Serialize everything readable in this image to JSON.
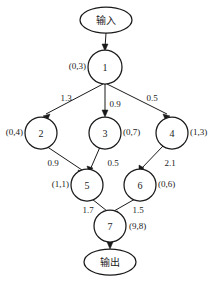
{
  "diagram": {
    "type": "directed-graph",
    "title": "",
    "terminals": [
      {
        "id": "input",
        "label": "输入",
        "cx": 106,
        "cy": 20,
        "rx": 26,
        "ry": 13
      },
      {
        "id": "output",
        "label": "输出",
        "cx": 110,
        "cy": 262,
        "rx": 26,
        "ry": 13
      }
    ],
    "nodes": [
      {
        "id": "1",
        "label": "1",
        "annotation": "(0,3)",
        "annotation_side": "left",
        "cx": 105,
        "cy": 67,
        "r": 17
      },
      {
        "id": "2",
        "label": "2",
        "annotation": "(0,4)",
        "annotation_side": "left",
        "cx": 41,
        "cy": 133,
        "r": 16
      },
      {
        "id": "3",
        "label": "3",
        "annotation": "(0,7)",
        "annotation_side": "right",
        "cx": 105,
        "cy": 133,
        "r": 16
      },
      {
        "id": "4",
        "label": "4",
        "annotation": "(1,3)",
        "annotation_side": "right",
        "cx": 172,
        "cy": 133,
        "r": 16
      },
      {
        "id": "5",
        "label": "5",
        "annotation": "(1,1)",
        "annotation_side": "left",
        "cx": 87,
        "cy": 185,
        "r": 16
      },
      {
        "id": "6",
        "label": "6",
        "annotation": "(0,6)",
        "annotation_side": "right",
        "cx": 140,
        "cy": 185,
        "r": 16
      },
      {
        "id": "7",
        "label": "7",
        "annotation": "(9,8)",
        "annotation_side": "right",
        "cx": 110,
        "cy": 226,
        "r": 16
      }
    ],
    "edges": [
      {
        "from": "input",
        "to": "1",
        "label": "",
        "label_x": 0,
        "label_y": 0
      },
      {
        "from": "1",
        "to": "2",
        "label": "1.3",
        "label_x": 66,
        "label_y": 98
      },
      {
        "from": "1",
        "to": "3",
        "label": "0.9",
        "label_x": 115,
        "label_y": 104
      },
      {
        "from": "1",
        "to": "4",
        "label": "0.5",
        "label_x": 152,
        "label_y": 98
      },
      {
        "from": "2",
        "to": "5",
        "label": "0.9",
        "label_x": 53,
        "label_y": 163
      },
      {
        "from": "3",
        "to": "5",
        "label": "0.5",
        "label_x": 113,
        "label_y": 163
      },
      {
        "from": "4",
        "to": "6",
        "label": "2.1",
        "label_x": 170,
        "label_y": 163
      },
      {
        "from": "5",
        "to": "7",
        "label": "1.7",
        "label_x": 88,
        "label_y": 210
      },
      {
        "from": "6",
        "to": "7",
        "label": "1.5",
        "label_x": 138,
        "label_y": 210
      },
      {
        "from": "7",
        "to": "output",
        "label": "",
        "label_x": 0,
        "label_y": 0
      }
    ]
  },
  "colors": {
    "stroke": "#1a1a1a",
    "fill": "#ffffff",
    "background": "#ffffff"
  }
}
